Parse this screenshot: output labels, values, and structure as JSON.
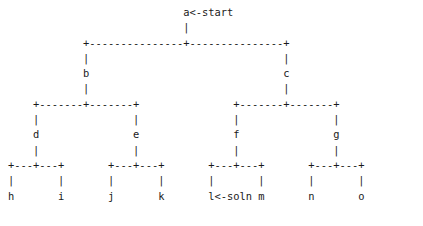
{
  "diagram": {
    "kind": "ascii-art-tree",
    "text_color": "#1a1a1a",
    "background_color": "#ffffff",
    "char_width_px": 6.1,
    "line_height_px": 15.3,
    "annotations": {
      "start_label": "a<-start",
      "solution_label": "l<-soln",
      "start_node": "a",
      "solution_node": "l"
    },
    "nodes": {
      "root": "a",
      "level2": [
        "b",
        "c"
      ],
      "level3": [
        "d",
        "e",
        "f",
        "g"
      ],
      "leaves": [
        "h",
        "i",
        "j",
        "k",
        "l",
        "m",
        "n",
        "o"
      ]
    },
    "lines": [
      "                            a<-start",
      "                            |",
      "            +---------------+---------------+",
      "            |                               |",
      "            b                               c",
      "            |                               |",
      "    +-------+-------+               +-------+-------+",
      "    |               |               |               |",
      "    d               e               f               g",
      "    |               |               |               |",
      "+---+---+       +---+---+       +---+---+       +---+---+",
      "|       |       |       |       |       |       |       |",
      "h       i       j       k       l<-soln m       n       o"
    ]
  }
}
